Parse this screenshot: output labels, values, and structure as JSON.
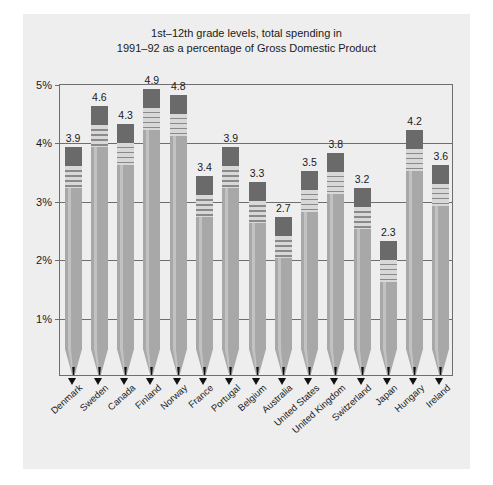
{
  "chart_data": {
    "type": "bar",
    "title": "1st–12th grade levels, total spending in\n1991–92 as a percentage of Gross Domestic Product",
    "xlabel": "",
    "ylabel": "",
    "ylim": [
      0,
      5
    ],
    "grid": true,
    "legend": "none",
    "ytick_labels": [
      "1%",
      "2%",
      "3%",
      "4%",
      "5%"
    ],
    "ytick_values": [
      1,
      2,
      3,
      4,
      5
    ],
    "categories": [
      "Denmark",
      "Sweden",
      "Canada",
      "Finland",
      "Norway",
      "France",
      "Portugal",
      "Belgium",
      "Australia",
      "United States",
      "United Kingdom",
      "Switzerland",
      "Japan",
      "Hungary",
      "Ireland"
    ],
    "values": [
      3.9,
      4.6,
      4.3,
      4.9,
      4.8,
      3.4,
      3.9,
      3.3,
      2.7,
      3.5,
      3.8,
      3.2,
      2.3,
      4.2,
      3.6
    ],
    "data_labels": [
      "3.9",
      "4.6",
      "4.3",
      "4.9",
      "4.8",
      "3.4",
      "3.9",
      "3.3",
      "2.7",
      "3.5",
      "3.8",
      "3.2",
      "2.3",
      "4.2",
      "3.6"
    ]
  },
  "colors": {
    "page_background": "#ffffff",
    "panel_background": "#eeeeee",
    "frame": "#6e6e6e",
    "pencil_body": "#a8a8a8",
    "pencil_highlight": "#c2c2c2",
    "eraser": "#6a6a6a",
    "ferrule": "#d8d8d8",
    "ferrule_band": "#8a8a8a",
    "graphite_tip": "#111111",
    "text": "#1a1a1a"
  }
}
